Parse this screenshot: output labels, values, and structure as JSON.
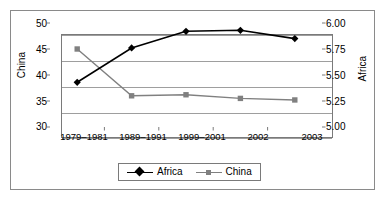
{
  "chart_data": {
    "type": "line",
    "title": "",
    "xlabel": "",
    "categories": [
      "1979–1981",
      "1989–1991",
      "1999–2001",
      "2002",
      "2003"
    ],
    "grid": true,
    "legend_position": "bottom",
    "series": [
      {
        "name": "Africa",
        "axis": "right",
        "color": "#000000",
        "marker": "diamond",
        "values": [
          5.43,
          5.76,
          5.92,
          5.93,
          5.85
        ]
      },
      {
        "name": "China",
        "axis": "left",
        "color": "#808080",
        "marker": "square",
        "values": [
          45.0,
          36.0,
          36.2,
          35.5,
          35.2
        ]
      }
    ],
    "left_axis": {
      "label": "China",
      "ylim": [
        30,
        50
      ],
      "ticks": [
        "30",
        "35",
        "40",
        "45",
        "50"
      ],
      "tick_values": [
        30,
        35,
        40,
        45,
        50
      ]
    },
    "right_axis": {
      "label": "Africa",
      "ylim": [
        5.0,
        6.0
      ],
      "ticks": [
        "5.00",
        "5.25",
        "5.50",
        "5.75",
        "6.00"
      ],
      "tick_values": [
        5.0,
        5.25,
        5.5,
        5.75,
        6.0
      ]
    }
  },
  "legend": {
    "items": [
      {
        "label": "Africa"
      },
      {
        "label": "China"
      }
    ]
  },
  "colors": {
    "africa": "#000000",
    "china": "#808080",
    "grid": "#9e9e9e",
    "border": "#7a7a7a"
  }
}
